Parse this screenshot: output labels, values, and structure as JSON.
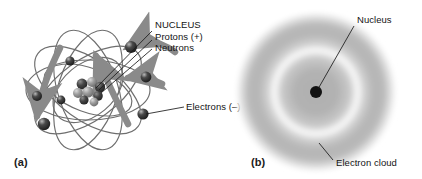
{
  "figure": {
    "background_color": "#ffffff",
    "width": 422,
    "height": 179
  },
  "panel_a": {
    "caption": "(a)",
    "model_name": "planetary-atom-model",
    "nucleus_label": {
      "title": "NUCLEUS",
      "line_protons": "Protons (+)",
      "line_neutrons": "Neutrons"
    },
    "electrons_label": "Electrons (–)",
    "colors": {
      "orbit_stroke": "#6e6e6e",
      "motion_arrow": "#8a8a8a",
      "electron_fill": "#2b2b2b",
      "electron_highlight": "#d8d8d8",
      "nucleon_proton": "#9a9a9a",
      "nucleon_neutron": "#3c3c3c",
      "leader_line": "#1a1a1a"
    },
    "orbits": [
      {
        "cx": 88,
        "cy": 90,
        "rx": 62,
        "ry": 30,
        "rotate": 0
      },
      {
        "cx": 88,
        "cy": 90,
        "rx": 62,
        "ry": 30,
        "rotate": 36
      },
      {
        "cx": 88,
        "cy": 90,
        "rx": 62,
        "ry": 30,
        "rotate": 72
      },
      {
        "cx": 88,
        "cy": 90,
        "rx": 62,
        "ry": 30,
        "rotate": 108
      },
      {
        "cx": 88,
        "cy": 90,
        "rx": 62,
        "ry": 30,
        "rotate": 144
      },
      {
        "cx": 88,
        "cy": 90,
        "rx": 46,
        "ry": 22,
        "rotate": 20
      }
    ],
    "electrons": [
      {
        "cx": 131,
        "cy": 47,
        "r": 6.0
      },
      {
        "cx": 146,
        "cy": 77,
        "r": 5.4
      },
      {
        "cx": 143,
        "cy": 114,
        "r": 5.6
      },
      {
        "cx": 44,
        "cy": 124,
        "r": 6.2
      },
      {
        "cx": 37,
        "cy": 96,
        "r": 5.0
      },
      {
        "cx": 70,
        "cy": 61,
        "r": 4.6
      },
      {
        "cx": 61,
        "cy": 100,
        "r": 4.4
      }
    ],
    "nucleons": [
      {
        "cx": 82,
        "cy": 84,
        "r": 5.4,
        "kind": "neutron"
      },
      {
        "cx": 92,
        "cy": 82,
        "r": 5.0,
        "kind": "proton"
      },
      {
        "cx": 100,
        "cy": 87,
        "r": 5.2,
        "kind": "neutron"
      },
      {
        "cx": 78,
        "cy": 93,
        "r": 5.0,
        "kind": "proton"
      },
      {
        "cx": 88,
        "cy": 92,
        "r": 5.6,
        "kind": "proton"
      },
      {
        "cx": 98,
        "cy": 96,
        "r": 4.8,
        "kind": "neutron"
      },
      {
        "cx": 84,
        "cy": 100,
        "r": 4.6,
        "kind": "neutron"
      },
      {
        "cx": 94,
        "cy": 102,
        "r": 4.4,
        "kind": "proton"
      }
    ]
  },
  "panel_b": {
    "caption": "(b)",
    "model_name": "electron-cloud-model",
    "nucleus_label": "Nucleus",
    "cloud_label": "Electron cloud",
    "colors": {
      "cloud_gray": "#b4b4b4",
      "ring_white": "#fcfcfc",
      "nucleus_dot": "#121212",
      "leader_line": "#1a1a1a"
    },
    "cloud": {
      "cx": 105,
      "cy": 92,
      "outer_radius": 78,
      "ring_radius": 46,
      "ring_width": 11
    },
    "nucleus_dot": {
      "cx": 105,
      "cy": 92,
      "r": 6.0
    }
  }
}
